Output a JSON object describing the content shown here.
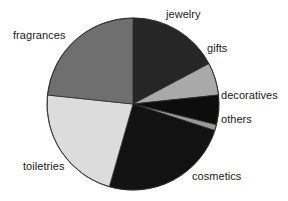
{
  "chart_data": {
    "type": "pie",
    "title": "",
    "subtitle": "",
    "xlabel": "",
    "ylabel": "",
    "legend_position": "none",
    "grid": false,
    "labels_outside": true,
    "start_angle_deg": 0,
    "direction": "clockwise",
    "categories": [
      "jewelry",
      "gifts",
      "decoratives",
      "others",
      "cosmetics",
      "toiletries",
      "fragrances"
    ],
    "values": [
      17.2,
      6.1,
      5.6,
      1.1,
      24.4,
      22.2,
      23.4
    ],
    "slices": [
      {
        "label": "jewelry",
        "value": 17.2,
        "start_deg": 0,
        "end_deg": 62,
        "color": "#262626",
        "label_x": 166,
        "label_y": 8
      },
      {
        "label": "gifts",
        "value": 6.1,
        "start_deg": 62,
        "end_deg": 84,
        "color": "#a9a9a9",
        "label_x": 207,
        "label_y": 42
      },
      {
        "label": "decoratives",
        "value": 5.6,
        "start_deg": 84,
        "end_deg": 104,
        "color": "#0d0d0d",
        "label_x": 221,
        "label_y": 89
      },
      {
        "label": "others",
        "value": 1.1,
        "start_deg": 104,
        "end_deg": 108,
        "color": "#9a9a9a",
        "label_x": 221,
        "label_y": 113
      },
      {
        "label": "cosmetics",
        "value": 24.4,
        "start_deg": 108,
        "end_deg": 196,
        "color": "#121212",
        "label_x": 192,
        "label_y": 170
      },
      {
        "label": "toiletries",
        "value": 22.2,
        "start_deg": 196,
        "end_deg": 276,
        "color": "#dcdcdc",
        "label_x": 23,
        "label_y": 160
      },
      {
        "label": "fragrances",
        "value": 23.4,
        "start_deg": 276,
        "end_deg": 360,
        "color": "#6f6f6f",
        "label_x": 13,
        "label_y": 29
      }
    ],
    "geometry": {
      "center_x": 133,
      "center_y": 104,
      "radius": 86
    },
    "style": {
      "background": "#ffffff",
      "edge_color": "#2b2b2b",
      "edge_width": 0.8,
      "text_color": "#1a1a1a"
    }
  }
}
